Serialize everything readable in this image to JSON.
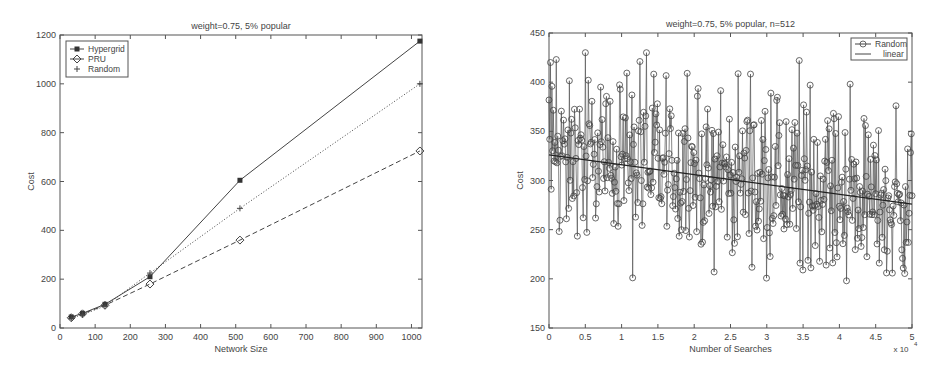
{
  "chart_data": [
    {
      "type": "line",
      "title": "weight=0.75, 5% popular",
      "xlabel": "Network Size",
      "ylabel": "Cost",
      "xlim": [
        0,
        1030
      ],
      "ylim": [
        0,
        1200
      ],
      "xticks": [
        0,
        100,
        200,
        300,
        400,
        500,
        600,
        700,
        800,
        900,
        1000
      ],
      "yticks": [
        0,
        200,
        400,
        600,
        800,
        1000,
        1200
      ],
      "grid": false,
      "legend_position": "upper-left",
      "x": [
        32,
        64,
        128,
        256,
        512,
        1024
      ],
      "series": [
        {
          "name": "Hypergrid",
          "style": "solid",
          "marker": "filled-square",
          "values": [
            45,
            60,
            97,
            210,
            605,
            1175
          ]
        },
        {
          "name": "PRU",
          "style": "dashed",
          "marker": "diamond",
          "values": [
            42,
            58,
            93,
            180,
            360,
            725
          ]
        },
        {
          "name": "Random",
          "style": "dotted",
          "marker": "plus",
          "values": [
            40,
            55,
            90,
            225,
            490,
            1000
          ]
        }
      ]
    },
    {
      "type": "line",
      "title": "weight=0.75, 5% popular, n=512",
      "xlabel": "Number of Searches",
      "ylabel": "Cost",
      "x_multiplier_label": "x 10",
      "x_multiplier_exp": "4",
      "xlim": [
        0,
        5
      ],
      "ylim": [
        150,
        450
      ],
      "xticks": [
        0,
        0.5,
        1,
        1.5,
        2,
        2.5,
        3,
        3.5,
        4,
        4.5,
        5
      ],
      "yticks": [
        150,
        200,
        250,
        300,
        350,
        400,
        450
      ],
      "grid": false,
      "legend_position": "upper-right",
      "series": [
        {
          "name": "Random",
          "style": "solid",
          "marker": "circle",
          "n_points": 500,
          "mean_start": 326,
          "mean_end": 276,
          "range": [
            198,
            430
          ],
          "notable_points": [
            [
              0.02,
              420
            ],
            [
              0.1,
              423
            ],
            [
              0.5,
              430
            ],
            [
              1.15,
              201
            ],
            [
              1.25,
              421
            ],
            [
              1.9,
              409
            ],
            [
              2.27,
              207
            ],
            [
              3.45,
              422
            ],
            [
              3.5,
              209
            ],
            [
              3.6,
              397
            ],
            [
              4.1,
              198
            ],
            [
              4.15,
              398
            ],
            [
              4.65,
              206
            ]
          ]
        },
        {
          "name": "linear",
          "style": "solid",
          "marker": "none",
          "values": [
            [
              0,
              326
            ],
            [
              5,
              276
            ]
          ]
        }
      ]
    }
  ]
}
